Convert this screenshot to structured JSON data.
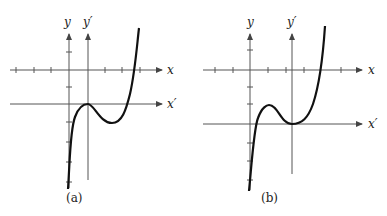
{
  "panels": [
    {
      "id": "a",
      "caption": "(a)",
      "labels": {
        "y": "y",
        "y_prime": "y′",
        "x": "x",
        "x_prime": "x′"
      },
      "description": "Cubic curve with local maximum touching the x′ axis at the y′ axis origin; local minimum below x′"
    },
    {
      "id": "b",
      "caption": "(b)",
      "labels": {
        "y": "y",
        "y_prime": "y′",
        "x": "x",
        "x_prime": "x′"
      },
      "description": "Cubic curve with local maximum above x′ axis and local minimum touching the x′ axis at the y′ axis origin"
    }
  ],
  "colors": {
    "axis": "#555555",
    "curve": "#111111",
    "text": "#222222"
  }
}
